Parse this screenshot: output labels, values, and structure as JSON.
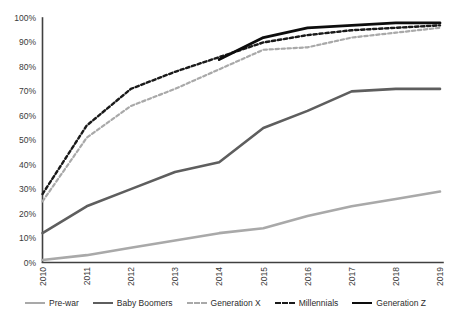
{
  "chart_data": {
    "type": "line",
    "title": "",
    "subtitle": "",
    "xlabel": "",
    "ylabel": "",
    "x": [
      "2010",
      "2011",
      "2012",
      "2013",
      "2014",
      "2015",
      "2016",
      "2017",
      "2018",
      "2019"
    ],
    "categories": [
      "2010",
      "2011",
      "2012",
      "2013",
      "2014",
      "2015",
      "2016",
      "2017",
      "2018",
      "2019"
    ],
    "xlim": [
      2010,
      2019
    ],
    "ylim": [
      0,
      100
    ],
    "ytick_labels": [
      "0%",
      "10%",
      "20%",
      "30%",
      "40%",
      "50%",
      "60%",
      "70%",
      "80%",
      "90%",
      "100%"
    ],
    "ytick_values": [
      0,
      10,
      20,
      30,
      40,
      50,
      60,
      70,
      80,
      90,
      100
    ],
    "xtick_labels": [
      "2010",
      "2011",
      "2012",
      "2013",
      "2014",
      "2015",
      "2016",
      "2017",
      "2018",
      "2019"
    ],
    "xtick_rotation": 90,
    "grid": false,
    "legend_position": "bottom",
    "series": [
      {
        "name": "Pre-war",
        "color": "#a9a9a9",
        "style": "solid",
        "width": 2.6,
        "values": [
          1,
          3,
          6,
          9,
          12,
          14,
          19,
          23,
          26,
          29
        ]
      },
      {
        "name": "Baby Boomers",
        "color": "#5e5e5e",
        "style": "solid",
        "width": 2.6,
        "values": [
          12,
          23,
          30,
          37,
          41,
          55,
          62,
          70,
          71,
          71
        ]
      },
      {
        "name": "Generation X",
        "color": "#a9a9a9",
        "style": "dashed",
        "width": 2.2,
        "values": [
          25,
          51,
          64,
          71,
          79,
          87,
          88,
          92,
          94,
          96
        ]
      },
      {
        "name": "Millennials",
        "color": "#1a1a1a",
        "style": "dashed",
        "width": 2.4,
        "values": [
          28,
          56,
          71,
          78,
          84,
          90,
          93,
          95,
          96,
          97
        ]
      },
      {
        "name": "Generation Z",
        "color": "#0d0d0d",
        "style": "solid",
        "width": 2.8,
        "values": [
          null,
          null,
          null,
          null,
          83,
          92,
          96,
          97,
          98,
          98
        ]
      }
    ]
  },
  "legend": {
    "items": [
      {
        "label": "Pre-war",
        "color": "#a9a9a9",
        "style": "solid"
      },
      {
        "label": "Baby Boomers",
        "color": "#5e5e5e",
        "style": "solid"
      },
      {
        "label": "Generation X",
        "color": "#a9a9a9",
        "style": "dashed"
      },
      {
        "label": "Millennials",
        "color": "#1a1a1a",
        "style": "dashed"
      },
      {
        "label": "Generation Z",
        "color": "#0d0d0d",
        "style": "solid"
      }
    ]
  },
  "axes": {
    "axis_color": "#404040",
    "tick_text_color": "#3a3a3a"
  }
}
